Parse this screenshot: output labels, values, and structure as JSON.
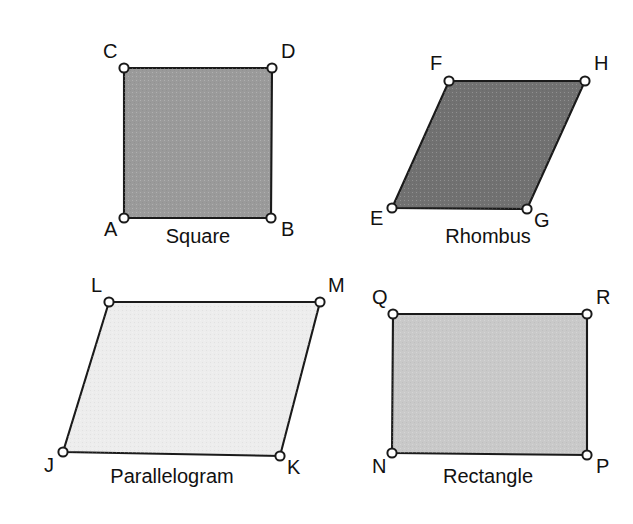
{
  "page": {
    "width": 633,
    "height": 524,
    "background": "#ffffff",
    "outline_color": "#1a1a1a",
    "label_color": "#111111",
    "vertex_fill": "#ffffff"
  },
  "chart_data": {
    "type": "diagram",
    "subtype": "geometry-figure-set",
    "figure_count": 4,
    "shapes": [
      {
        "id": "square",
        "caption": "Square",
        "fill": "#9a9a9a",
        "caption_x": 198,
        "caption_y": 243,
        "vertices": [
          {
            "label": "A",
            "x": 124,
            "y": 218,
            "lx": 104,
            "ly": 236
          },
          {
            "label": "B",
            "x": 271,
            "y": 218,
            "lx": 281,
            "ly": 236
          },
          {
            "label": "C",
            "x": 124,
            "y": 68,
            "lx": 103,
            "ly": 58
          },
          {
            "label": "D",
            "x": 272,
            "y": 68,
            "lx": 281,
            "ly": 58
          }
        ],
        "path_order": [
          "A",
          "B",
          "D",
          "C"
        ]
      },
      {
        "id": "rhombus",
        "caption": "Rhombus",
        "fill": "#717171",
        "caption_x": 488,
        "caption_y": 243,
        "vertices": [
          {
            "label": "E",
            "x": 392,
            "y": 208,
            "lx": 370,
            "ly": 225
          },
          {
            "label": "F",
            "x": 449,
            "y": 81,
            "lx": 430,
            "ly": 70
          },
          {
            "label": "G",
            "x": 527,
            "y": 209,
            "lx": 534,
            "ly": 227
          },
          {
            "label": "H",
            "x": 585,
            "y": 81,
            "lx": 594,
            "ly": 70
          }
        ],
        "path_order": [
          "E",
          "F",
          "H",
          "G"
        ]
      },
      {
        "id": "parallelogram",
        "caption": "Parallelogram",
        "fill": "#ededed",
        "caption_x": 172,
        "caption_y": 483,
        "vertices": [
          {
            "label": "J",
            "x": 63,
            "y": 452,
            "lx": 44,
            "ly": 472
          },
          {
            "label": "K",
            "x": 280,
            "y": 456,
            "lx": 287,
            "ly": 474
          },
          {
            "label": "L",
            "x": 109,
            "y": 302,
            "lx": 91,
            "ly": 292
          },
          {
            "label": "M",
            "x": 320,
            "y": 302,
            "lx": 328,
            "ly": 292
          }
        ],
        "path_order": [
          "J",
          "K",
          "M",
          "L"
        ]
      },
      {
        "id": "rectangle",
        "caption": "Rectangle",
        "fill": "#c9c9c9",
        "caption_x": 488,
        "caption_y": 483,
        "vertices": [
          {
            "label": "N",
            "x": 392,
            "y": 453,
            "lx": 372,
            "ly": 473
          },
          {
            "label": "P",
            "x": 587,
            "y": 455,
            "lx": 596,
            "ly": 473
          },
          {
            "label": "Q",
            "x": 393,
            "y": 314,
            "lx": 372,
            "ly": 304
          },
          {
            "label": "R",
            "x": 587,
            "y": 314,
            "lx": 596,
            "ly": 304
          }
        ],
        "path_order": [
          "N",
          "P",
          "R",
          "Q"
        ]
      }
    ]
  }
}
